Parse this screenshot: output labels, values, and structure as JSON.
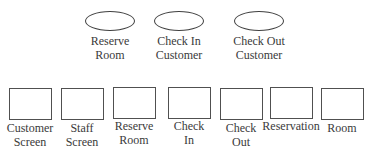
{
  "use_cases": [
    {
      "label_line1": "Reserve",
      "label_line2": "Room"
    },
    {
      "label_line1": "Check In",
      "label_line2": "Customer"
    },
    {
      "label_line1": "Check Out",
      "label_line2": "Customer"
    }
  ],
  "classes": [
    {
      "label_line1": "Customer",
      "label_line2": "Screen"
    },
    {
      "label_line1": "Staff",
      "label_line2": "Screen"
    },
    {
      "label_line1": "Reserve",
      "label_line2": "Room"
    },
    {
      "label_line1": "Check",
      "label_line2": "In"
    },
    {
      "label_line1": "Check",
      "label_line2": "Out"
    },
    {
      "label_line1": "Reservation",
      "label_line2": ""
    },
    {
      "label_line1": "Room",
      "label_line2": ""
    }
  ]
}
